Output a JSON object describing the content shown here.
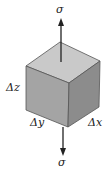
{
  "diagram": {
    "type": "stress-element-cube",
    "labels": {
      "sigma_top": "σ",
      "sigma_bottom": "σ",
      "dz": "Δz",
      "dy": "Δy",
      "dx": "Δx"
    },
    "colors": {
      "top_face": "#c9c9c9",
      "front_face": "#a4a4a4",
      "right_face": "#8c8c8c",
      "edge": "#555555",
      "arrow": "#222222"
    }
  }
}
